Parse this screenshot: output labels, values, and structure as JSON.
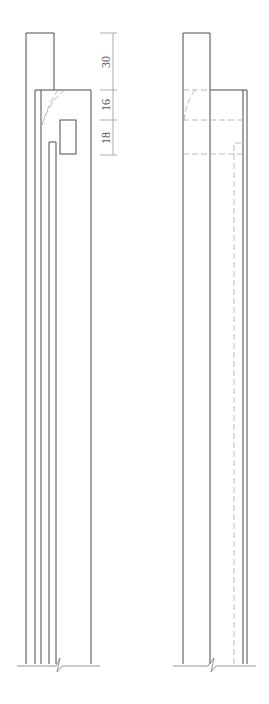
{
  "drawing": {
    "type": "technical-elevation",
    "views": [
      "left-elevation",
      "right-elevation"
    ],
    "colors": {
      "line": "#4a4a4a",
      "hidden_line": "#a8a8a8",
      "dimension": "#8a8a8a"
    }
  },
  "dimensions": {
    "d1": "30",
    "d2": "16",
    "d3": "18"
  }
}
